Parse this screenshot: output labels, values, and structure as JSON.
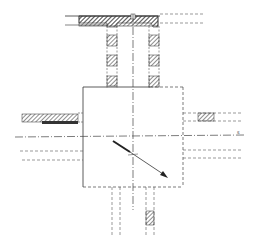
{
  "diagram": {
    "type": "technical-drawing",
    "colors": {
      "line": "#333333",
      "hatch": "#555555",
      "background": "#ffffff"
    },
    "labels": {
      "axis_end_label": "s"
    },
    "elements": {
      "top_beam": "hatched horizontal beam",
      "columns": "two vertical columns with hatched blocks",
      "central_box": "square with dashed right and bottom edges",
      "left_member": "hatched horizontal member on left",
      "right_member": "hatched block on right",
      "bottom_member": "vertical dashed member with hatched segment",
      "arrow": "diagonal arrow pointing down-right"
    }
  }
}
